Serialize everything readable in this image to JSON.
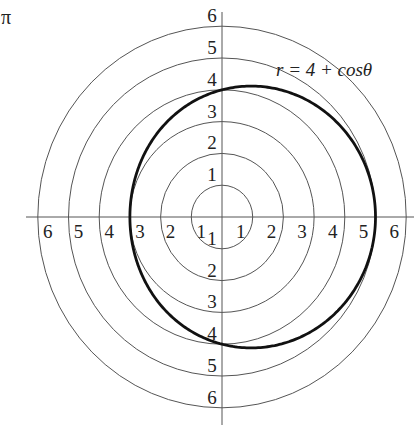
{
  "corner_label": "π",
  "chart_data": {
    "type": "polar",
    "title": "",
    "equation_label": "r = 4 + cosθ",
    "curve": {
      "name": "r = 4 + cosθ",
      "a": 4,
      "b": 1,
      "func": "cos",
      "stroke": "#111111"
    },
    "grid": {
      "rings": [
        1,
        2,
        3,
        4,
        5,
        6
      ],
      "axes": true,
      "ring_color": "#555555",
      "axis_color": "#555555"
    },
    "tick_labels": {
      "positive_x": [
        "1",
        "2",
        "3",
        "4",
        "5",
        "6"
      ],
      "negative_x": [
        "1",
        "2",
        "3",
        "4",
        "5",
        "6"
      ],
      "positive_y": [
        "1",
        "2",
        "3",
        "4",
        "5",
        "6"
      ],
      "negative_y": [
        "1",
        "2",
        "3",
        "4",
        "5",
        "6"
      ]
    },
    "key_points": [
      {
        "theta": "0",
        "r": 5
      },
      {
        "theta": "π/2",
        "r": 4
      },
      {
        "theta": "π",
        "r": 3
      },
      {
        "theta": "3π/2",
        "r": 4
      }
    ],
    "rlim": [
      0,
      6
    ]
  }
}
